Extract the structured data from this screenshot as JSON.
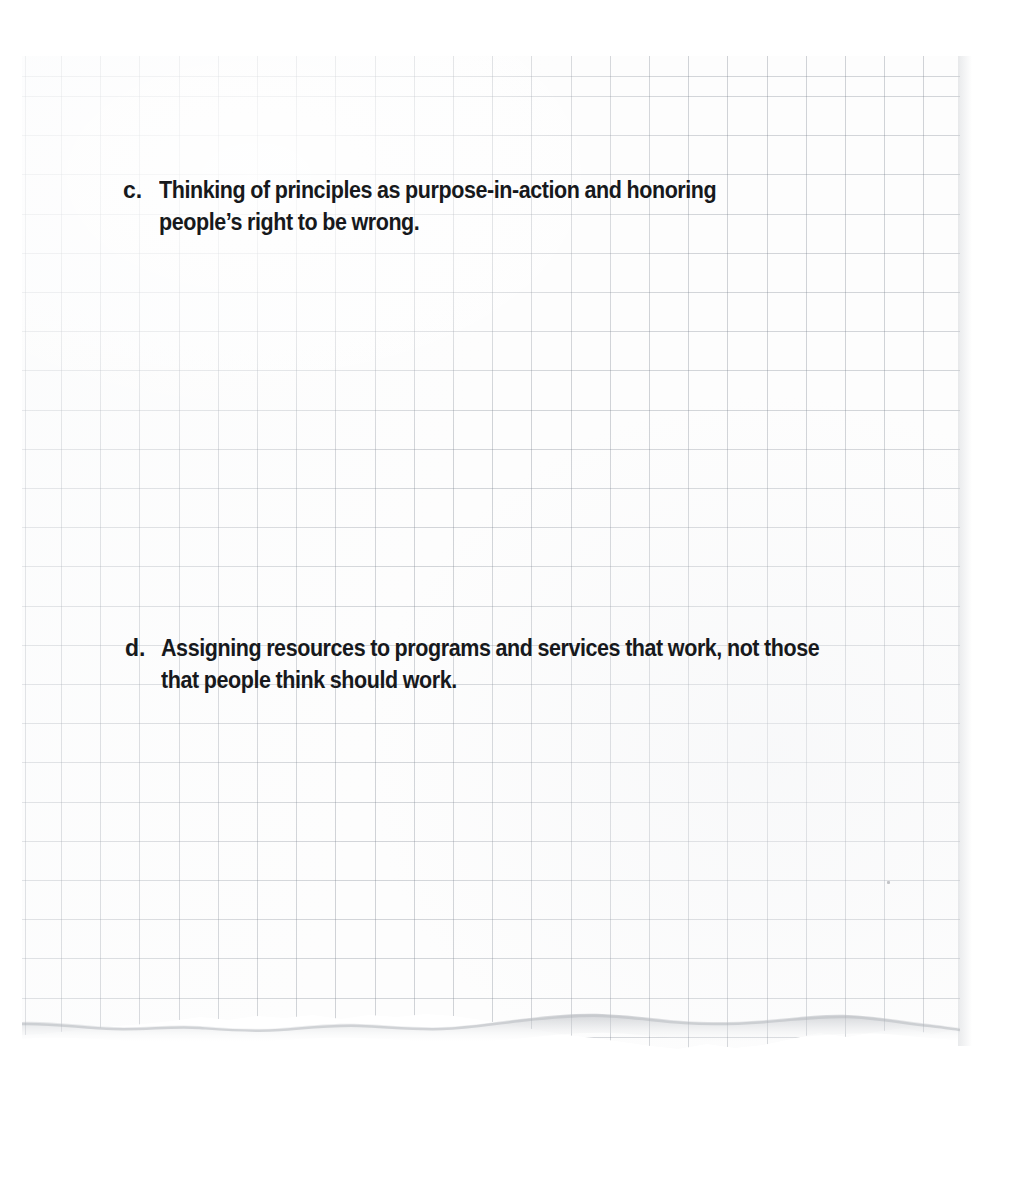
{
  "document": {
    "kind": "scanned-graph-paper-note",
    "page_background": "#ffffff",
    "paper_color": "#fdfdfd",
    "grid_line_color": "#7b838c",
    "ink_color": "#17191c",
    "bottom_edge": "torn",
    "right_edge": "trimmed"
  },
  "notes": {
    "items": [
      {
        "marker": "c.",
        "text": "Thinking of principles as purpose-in-action and honoring\npeople’s right to be wrong.",
        "lines": [
          "Thinking of principles as purpose-in-action and honoring",
          "people’s right to be wrong."
        ]
      },
      {
        "marker": "d.",
        "text": "Assigning resources to programs and services that work, not those\nthat people think should work.",
        "lines": [
          "Assigning resources to programs and services that work, not those",
          "that people think should work."
        ]
      }
    ]
  }
}
